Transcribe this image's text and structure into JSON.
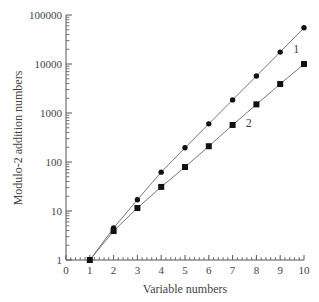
{
  "chart_data": {
    "type": "line",
    "title": "",
    "xlabel": "Variable numbers",
    "ylabel": "Modulo-2 addition numbers",
    "xlim": [
      0,
      10
    ],
    "ylim": [
      1,
      100000
    ],
    "yscale": "log",
    "grid": false,
    "x_ticks": [
      "0",
      "1",
      "2",
      "3",
      "4",
      "5",
      "6",
      "7",
      "8",
      "9",
      "10"
    ],
    "y_ticks": [
      "1",
      "10",
      "100",
      "1000",
      "10000",
      "100000"
    ],
    "x": [
      1,
      2,
      3,
      4,
      5,
      6,
      7,
      8,
      9,
      10
    ],
    "series": [
      {
        "name": "1",
        "marker": "circle",
        "values": [
          1,
          4.5,
          17,
          62,
          195,
          600,
          1850,
          5700,
          17500,
          55000
        ]
      },
      {
        "name": "2",
        "marker": "square",
        "values": [
          1,
          3.9,
          11.5,
          31,
          79,
          210,
          570,
          1500,
          3900,
          10000
        ]
      }
    ],
    "annotations": [
      {
        "text": "1",
        "near_series": "1",
        "x": 9.3
      },
      {
        "text": "2",
        "near_series": "2",
        "x": 7.3
      }
    ],
    "colors": {
      "line": "#777777",
      "marker": "#111111",
      "axis": "#555555"
    }
  }
}
